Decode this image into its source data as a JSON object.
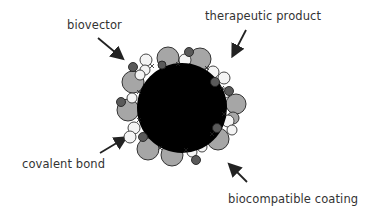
{
  "diagram": {
    "labels": {
      "biovector": "biovector",
      "therapeutic_product": "therapeutic product",
      "covalent_bond": "covalent bond",
      "biocompatible_coating": "biocompatible coating"
    },
    "colors": {
      "core": "#000000",
      "coating": "#a6a6a6",
      "therapeutic_product": "#f4f4f4",
      "biovector": "#5a5a5a",
      "outline": "#333333",
      "text": "#333333"
    }
  }
}
